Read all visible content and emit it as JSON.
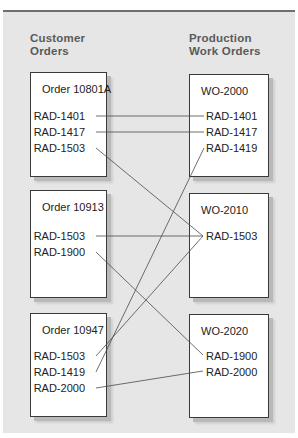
{
  "diagram": {
    "top_cut_title": "",
    "headers": {
      "left": [
        "Customer",
        "Orders"
      ],
      "right": [
        "Production",
        "Work Orders"
      ]
    },
    "customer_orders": [
      {
        "title": "Order 10801A",
        "items": [
          "RAD-1401",
          "RAD-1417",
          "RAD-1503"
        ]
      },
      {
        "title": "Order 10913",
        "items": [
          "RAD-1503",
          "RAD-1900"
        ]
      },
      {
        "title": "Order 10947",
        "items": [
          "RAD-1503",
          "RAD-1419",
          "RAD-2000"
        ]
      }
    ],
    "work_orders": [
      {
        "title": "WO-2000",
        "items": [
          "RAD-1401",
          "RAD-1417",
          "RAD-1419"
        ]
      },
      {
        "title": "WO-2010",
        "items": [
          "RAD-1503"
        ]
      },
      {
        "title": "WO-2020",
        "items": [
          "RAD-1900",
          "RAD-2000"
        ]
      }
    ],
    "links": [
      {
        "from": "Order 10801A / RAD-1401",
        "to": "WO-2000 / RAD-1401"
      },
      {
        "from": "Order 10801A / RAD-1417",
        "to": "WO-2000 / RAD-1417"
      },
      {
        "from": "Order 10801A / RAD-1503",
        "to": "WO-2010 / RAD-1503"
      },
      {
        "from": "Order 10913 / RAD-1503",
        "to": "WO-2010 / RAD-1503"
      },
      {
        "from": "Order 10913 / RAD-1900",
        "to": "WO-2020 / RAD-1900"
      },
      {
        "from": "Order 10947 / RAD-1503",
        "to": "WO-2010 / RAD-1503"
      },
      {
        "from": "Order 10947 / RAD-1419",
        "to": "WO-2000 / RAD-1419"
      },
      {
        "from": "Order 10947 / RAD-2000",
        "to": "WO-2020 / RAD-2000"
      }
    ],
    "colors": {
      "panel_bg": "#e6e6e6",
      "rule": "#6e6e6e",
      "header_text": "#5a5a5a",
      "box_border": "#3a3a3a",
      "shadow": "#b9b9b9",
      "line": "#4a4a4a"
    }
  }
}
